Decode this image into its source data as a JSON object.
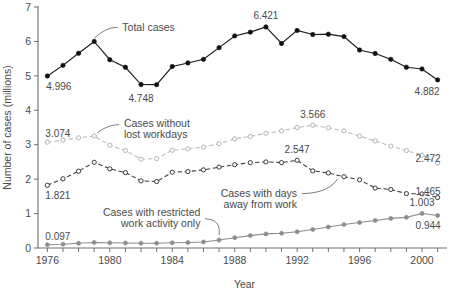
{
  "chart_data": {
    "type": "line",
    "title": "",
    "xlabel": "Year",
    "ylabel": "Number of cases (millions)",
    "xlim": [
      1975.4,
      2001.6
    ],
    "ylim": [
      0,
      7
    ],
    "yticks": [
      "0",
      "1",
      "2",
      "3",
      "4",
      "5",
      "6",
      "7"
    ],
    "xticks": [
      "1976",
      "1980",
      "1984",
      "1988",
      "1992",
      "1996",
      "2000"
    ],
    "grid": false,
    "legend_position": "inline-annotations",
    "x": [
      1976,
      1977,
      1978,
      1979,
      1980,
      1981,
      1982,
      1983,
      1984,
      1985,
      1986,
      1987,
      1988,
      1989,
      1990,
      1991,
      1992,
      1993,
      1994,
      1995,
      1996,
      1997,
      1998,
      1999,
      2000,
      2001
    ],
    "series": [
      {
        "name": "Total cases",
        "marker": "filled-circle",
        "color": "#111111",
        "linestyle": "solid",
        "values": [
          4.996,
          5.305,
          5.655,
          6.0,
          5.47,
          5.25,
          4.748,
          4.745,
          5.27,
          5.375,
          5.48,
          5.82,
          6.16,
          6.27,
          6.421,
          5.94,
          6.32,
          6.2,
          6.21,
          6.14,
          5.75,
          5.65,
          5.48,
          5.25,
          5.2,
          4.882
        ]
      },
      {
        "name": "Cases without lost workdays",
        "marker": "open-circle",
        "color": "#b4b4b4",
        "linestyle": "dashed",
        "values": [
          3.074,
          3.135,
          3.2,
          3.255,
          2.985,
          2.83,
          2.58,
          2.595,
          2.84,
          2.88,
          2.93,
          3.03,
          3.17,
          3.24,
          3.33,
          3.4,
          3.5,
          3.566,
          3.49,
          3.4,
          3.25,
          3.11,
          2.96,
          2.83,
          2.7,
          2.472
        ]
      },
      {
        "name": "Cases with days away from work",
        "marker": "open-circle",
        "color": "#3a3a3a",
        "linestyle": "dashed",
        "values": [
          1.821,
          2.01,
          2.23,
          2.49,
          2.3,
          2.19,
          1.95,
          1.93,
          2.2,
          2.22,
          2.27,
          2.35,
          2.42,
          2.48,
          2.5,
          2.48,
          2.547,
          2.24,
          2.18,
          2.07,
          1.98,
          1.74,
          1.7,
          1.58,
          1.57,
          1.465
        ]
      },
      {
        "name": "Cases with restricted work activity only",
        "marker": "filled-circle-gray",
        "color": "#8c8c8c",
        "linestyle": "solid",
        "values": [
          0.097,
          0.11,
          0.135,
          0.16,
          0.15,
          0.145,
          0.14,
          0.14,
          0.15,
          0.16,
          0.175,
          0.23,
          0.3,
          0.36,
          0.41,
          0.43,
          0.47,
          0.54,
          0.61,
          0.68,
          0.74,
          0.8,
          0.86,
          0.89,
          1.003,
          0.944
        ]
      }
    ],
    "point_labels": [
      {
        "text": "4.996",
        "series": "Total cases",
        "year": 1976
      },
      {
        "text": "4.748",
        "series": "Total cases",
        "year": 1982
      },
      {
        "text": "6.421",
        "series": "Total cases",
        "year": 1990
      },
      {
        "text": "4.882",
        "series": "Total cases",
        "year": 2001
      },
      {
        "text": "3.074",
        "series": "Cases without lost workdays",
        "year": 1976
      },
      {
        "text": "3.566",
        "series": "Cases without lost workdays",
        "year": 1993
      },
      {
        "text": "2.472",
        "series": "Cases without lost workdays",
        "year": 2001
      },
      {
        "text": "1.821",
        "series": "Cases with days away from work",
        "year": 1976
      },
      {
        "text": "2.547",
        "series": "Cases with days away from work",
        "year": 1992
      },
      {
        "text": "1.465",
        "series": "Cases with days away from work",
        "year": 2001
      },
      {
        "text": "0.097",
        "series": "Cases with restricted work activity only",
        "year": 1976
      },
      {
        "text": "1.003",
        "series": "Cases with restricted work activity only",
        "year": 2000
      },
      {
        "text": "0.944",
        "series": "Cases with restricted work activity only",
        "year": 2001
      }
    ],
    "annotations": [
      {
        "name": "total-cases",
        "line1": "Total cases",
        "line2": ""
      },
      {
        "name": "cases-without-lost",
        "line1": "Cases without",
        "line2": "lost workdays"
      },
      {
        "name": "cases-days-away",
        "line1": "Cases with days",
        "line2": "away from work"
      },
      {
        "name": "cases-restricted",
        "line1": "Cases with restricted",
        "line2": "work activity only"
      }
    ]
  }
}
